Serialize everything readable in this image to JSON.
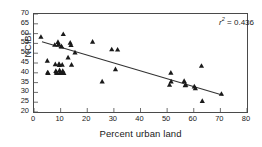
{
  "chart_data": {
    "type": "scatter",
    "title": "",
    "xlabel": "Percent urban land",
    "ylabel": "NCIBI",
    "xlim": [
      0,
      80
    ],
    "ylim": [
      20,
      70
    ],
    "xticks": [
      0,
      10,
      20,
      30,
      40,
      50,
      60,
      70,
      80
    ],
    "yticks": [
      20,
      25,
      30,
      35,
      40,
      45,
      50,
      55,
      60,
      65,
      70
    ],
    "grid": false,
    "legend": null,
    "marker": "triangle",
    "marker_color": "#1a1a1a",
    "annotations": [
      {
        "name": "r-squared",
        "symbol": "r",
        "superscript": "2",
        "equals": " = ",
        "value": "0.436",
        "text": "r2 = 0.436",
        "position": "top-right"
      }
    ],
    "trendline": {
      "type": "linear",
      "x_start": 3.0,
      "y_start": 55.8,
      "x_end": 71.0,
      "y_end": 28.5,
      "color": "#333333"
    },
    "points": [
      {
        "x": 2.6,
        "y": 58.4
      },
      {
        "x": 5.0,
        "y": 46.2
      },
      {
        "x": 5.1,
        "y": 40.2
      },
      {
        "x": 5.3,
        "y": 40.0
      },
      {
        "x": 7.8,
        "y": 54.3
      },
      {
        "x": 8.0,
        "y": 44.4
      },
      {
        "x": 8.2,
        "y": 41.0
      },
      {
        "x": 8.4,
        "y": 40.2
      },
      {
        "x": 8.6,
        "y": 40.0
      },
      {
        "x": 9.0,
        "y": 55.8
      },
      {
        "x": 9.2,
        "y": 54.6
      },
      {
        "x": 9.4,
        "y": 44.6
      },
      {
        "x": 9.5,
        "y": 44.0
      },
      {
        "x": 9.6,
        "y": 41.4
      },
      {
        "x": 9.8,
        "y": 40.4
      },
      {
        "x": 9.9,
        "y": 40.0
      },
      {
        "x": 10.2,
        "y": 53.6
      },
      {
        "x": 10.4,
        "y": 53.4
      },
      {
        "x": 10.6,
        "y": 44.2
      },
      {
        "x": 10.8,
        "y": 41.0
      },
      {
        "x": 10.9,
        "y": 40.2
      },
      {
        "x": 11.0,
        "y": 59.8
      },
      {
        "x": 11.2,
        "y": 40.0
      },
      {
        "x": 12.8,
        "y": 47.9
      },
      {
        "x": 13.6,
        "y": 55.4
      },
      {
        "x": 13.9,
        "y": 54.2
      },
      {
        "x": 14.1,
        "y": 44.2
      },
      {
        "x": 15.4,
        "y": 50.4
      },
      {
        "x": 22.0,
        "y": 55.9
      },
      {
        "x": 25.6,
        "y": 35.6
      },
      {
        "x": 29.2,
        "y": 52.0
      },
      {
        "x": 30.6,
        "y": 41.9
      },
      {
        "x": 31.4,
        "y": 51.9
      },
      {
        "x": 50.9,
        "y": 33.9
      },
      {
        "x": 51.4,
        "y": 40.1
      },
      {
        "x": 51.5,
        "y": 35.6
      },
      {
        "x": 56.4,
        "y": 35.9
      },
      {
        "x": 56.8,
        "y": 33.7
      },
      {
        "x": 57.0,
        "y": 34.0
      },
      {
        "x": 60.2,
        "y": 33.1
      },
      {
        "x": 60.6,
        "y": 32.2
      },
      {
        "x": 62.9,
        "y": 43.6
      },
      {
        "x": 63.2,
        "y": 25.7
      },
      {
        "x": 70.4,
        "y": 29.3
      }
    ]
  }
}
